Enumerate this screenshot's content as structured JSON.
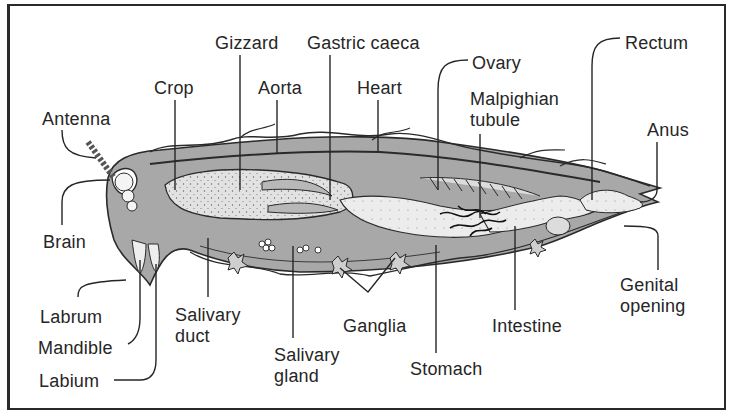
{
  "diagram": {
    "colors": {
      "ink": "#262626",
      "body_fill": "#9a9a9a",
      "gut_fill": "#d8d8d8",
      "organ_light": "#eeeeee",
      "background": "#ffffff"
    },
    "labels": [
      {
        "id": "antenna",
        "text": "Antenna",
        "x": 42,
        "y": 109
      },
      {
        "id": "crop",
        "text": "Crop",
        "x": 154,
        "y": 78
      },
      {
        "id": "gizzard",
        "text": "Gizzard",
        "x": 215,
        "y": 33
      },
      {
        "id": "gastric_caeca",
        "text": "Gastric caeca",
        "x": 307,
        "y": 33
      },
      {
        "id": "aorta",
        "text": "Aorta",
        "x": 258,
        "y": 78
      },
      {
        "id": "heart",
        "text": "Heart",
        "x": 357,
        "y": 78
      },
      {
        "id": "ovary",
        "text": "Ovary",
        "x": 472,
        "y": 53
      },
      {
        "id": "malpighian_tubule",
        "text": "Malpighian\ntubule",
        "x": 470,
        "y": 89
      },
      {
        "id": "rectum",
        "text": "Rectum",
        "x": 625,
        "y": 33
      },
      {
        "id": "anus",
        "text": "Anus",
        "x": 647,
        "y": 120
      },
      {
        "id": "brain",
        "text": "Brain",
        "x": 43,
        "y": 232
      },
      {
        "id": "labrum",
        "text": "Labrum",
        "x": 40,
        "y": 307
      },
      {
        "id": "mandible",
        "text": "Mandible",
        "x": 38,
        "y": 338
      },
      {
        "id": "labium",
        "text": "Labium",
        "x": 39,
        "y": 371
      },
      {
        "id": "salivary_duct",
        "text": "Salivary\nduct",
        "x": 175,
        "y": 305
      },
      {
        "id": "salivary_gland",
        "text": "Salivary\ngland",
        "x": 274,
        "y": 345
      },
      {
        "id": "ganglia",
        "text": "Ganglia",
        "x": 343,
        "y": 316
      },
      {
        "id": "stomach",
        "text": "Stomach",
        "x": 410,
        "y": 359
      },
      {
        "id": "intestine",
        "text": "Intestine",
        "x": 492,
        "y": 316
      },
      {
        "id": "genital_opening",
        "text": "Genital\nopening",
        "x": 620,
        "y": 275
      }
    ]
  }
}
